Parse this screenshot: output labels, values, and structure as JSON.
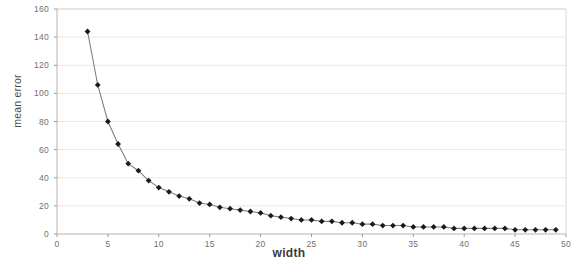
{
  "chart_data": {
    "type": "line",
    "title": "",
    "xlabel": "width",
    "ylabel": "mean error",
    "xlim": [
      0,
      50
    ],
    "ylim": [
      0,
      160
    ],
    "grid": true,
    "legend": false,
    "marker": "diamond",
    "line_color": "#808080",
    "marker_color": "#1a1a1a",
    "grid_color": "#e8e8e8",
    "xticks": [
      "0",
      "5",
      "10",
      "15",
      "20",
      "25",
      "30",
      "35",
      "40",
      "45",
      "50"
    ],
    "yticks": [
      "0",
      "20",
      "40",
      "60",
      "80",
      "100",
      "120",
      "140",
      "160"
    ],
    "x": [
      3,
      4,
      5,
      6,
      7,
      8,
      9,
      10,
      11,
      12,
      13,
      14,
      15,
      16,
      17,
      18,
      19,
      20,
      21,
      22,
      23,
      24,
      25,
      26,
      27,
      28,
      29,
      30,
      31,
      32,
      33,
      34,
      35,
      36,
      37,
      38,
      39,
      40,
      41,
      42,
      43,
      44,
      45,
      46,
      47,
      48,
      49
    ],
    "values": [
      144,
      106,
      80,
      64,
      50,
      45,
      38,
      33,
      30,
      27,
      25,
      22,
      21,
      19,
      18,
      17,
      16,
      15,
      13,
      12,
      11,
      10,
      10,
      9,
      9,
      8,
      8,
      7,
      7,
      6,
      6,
      6,
      5,
      5,
      5,
      5,
      4,
      4,
      4,
      4,
      4,
      4,
      3,
      3,
      3,
      3,
      3
    ],
    "series_name": "mean error"
  }
}
